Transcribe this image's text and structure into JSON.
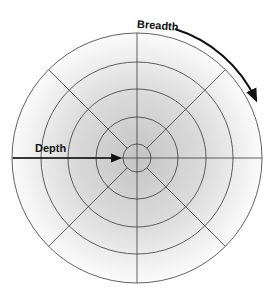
{
  "diagram": {
    "type": "polar-grid",
    "center": {
      "x": 137,
      "y": 158
    },
    "ring_radii": [
      14,
      41,
      69,
      96,
      125
    ],
    "spoke_angles_deg": [
      0,
      45,
      90,
      135,
      180,
      225,
      270,
      315
    ],
    "gradient": {
      "center_color": "#c4c4c4",
      "edge_color": "#fbfbfb"
    },
    "line_color": "#3a3a3a",
    "arrow_color": "#111111"
  },
  "labels": {
    "breadth": "Breadth",
    "depth": "Depth"
  }
}
